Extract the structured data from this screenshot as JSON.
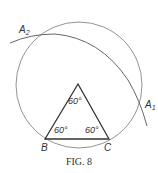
{
  "figure": {
    "caption": "Fig. 8",
    "caption_display": "FIG. 8",
    "points": {
      "A1": "A",
      "A1_sub": "1",
      "A2": "A",
      "A2_sub": "2",
      "B": "B",
      "C": "C"
    },
    "angles": {
      "apex": "60°",
      "at_B": "60°",
      "at_C": "60°"
    },
    "colors": {
      "stroke": "#555555",
      "thick_stroke": "#333333",
      "text": "#333333"
    }
  }
}
